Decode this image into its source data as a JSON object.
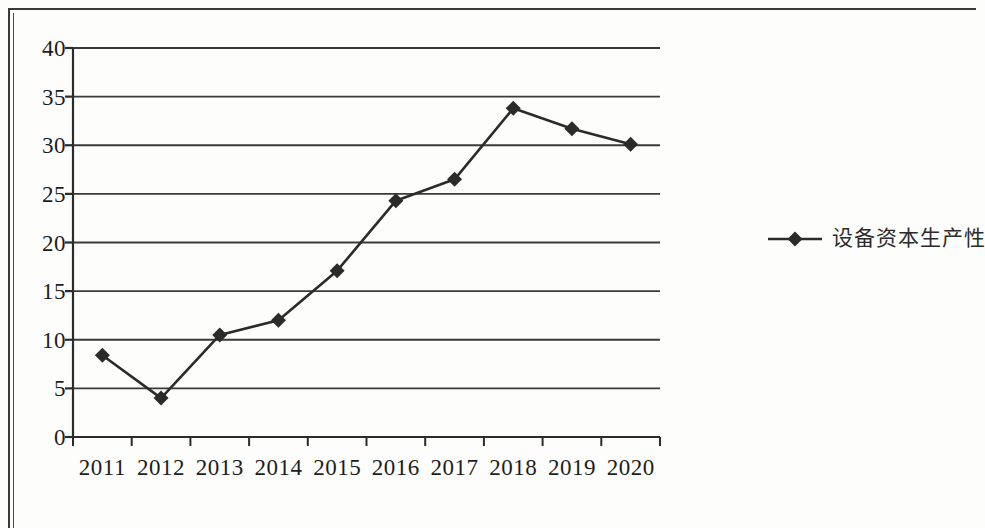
{
  "chart_data": {
    "type": "line",
    "title": "",
    "xlabel": "",
    "ylabel": "",
    "categories": [
      "2011",
      "2012",
      "2013",
      "2014",
      "2015",
      "2016",
      "2017",
      "2018",
      "2019",
      "2020"
    ],
    "series": [
      {
        "name": "设备资本生产性",
        "marker": "diamond",
        "color": "#2b2b2b",
        "values": [
          8.4,
          4.0,
          10.5,
          12.0,
          17.1,
          24.3,
          26.5,
          33.8,
          31.7,
          30.1
        ]
      }
    ],
    "ylim": [
      0,
      40
    ],
    "y_ticks": [
      0,
      5,
      10,
      15,
      20,
      25,
      30,
      35,
      40
    ],
    "y_tick_labels": [
      "0",
      "5",
      "10",
      "15",
      "20",
      "25",
      "30",
      "35",
      "40"
    ],
    "x_tick_labels": [
      "2011",
      "2012",
      "2013",
      "2014",
      "2015",
      "2016",
      "2017",
      "2018",
      "2019",
      "2020"
    ],
    "grid": "horizontal",
    "legend_position": "right"
  },
  "legend": {
    "entries": [
      {
        "label": "设备资本生产性",
        "marker": "diamond-line-marker"
      }
    ]
  },
  "colors": {
    "ink": "#2b2b2b",
    "grid": "#3a3a3a",
    "axis": "#2b2b2b",
    "page": "#fdfdfb",
    "frame": "#3a3a3a"
  }
}
